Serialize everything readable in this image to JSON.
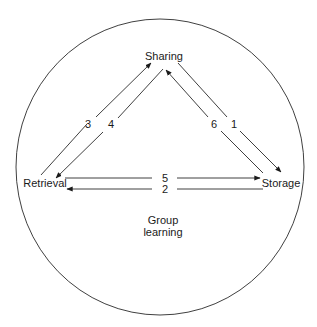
{
  "diagram": {
    "boundary_label": [
      "Group",
      "learning"
    ],
    "nodes": {
      "sharing": "Sharing",
      "retrieval": "Retrieval",
      "storage": "Storage"
    },
    "edges": [
      {
        "label": "1",
        "from": "Sharing",
        "to": "Storage"
      },
      {
        "label": "2",
        "from": "Storage",
        "to": "Retrieval"
      },
      {
        "label": "3",
        "from": "Retrieval",
        "to": "Sharing"
      },
      {
        "label": "4",
        "from": "Sharing",
        "to": "Retrieval"
      },
      {
        "label": "5",
        "from": "Retrieval",
        "to": "Storage"
      },
      {
        "label": "6",
        "from": "Storage",
        "to": "Sharing"
      }
    ],
    "colors": {
      "line": "#2a2a2a",
      "text": "#1a1a1a",
      "background": "#ffffff"
    }
  }
}
